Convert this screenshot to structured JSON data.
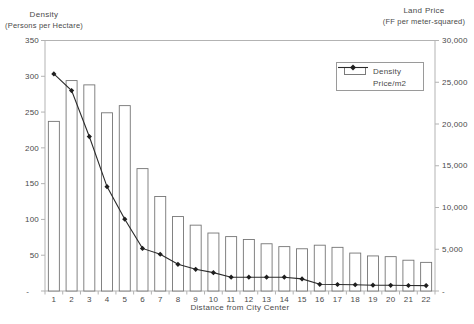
{
  "chart_data": {
    "type": "bar",
    "title": "",
    "categories": [
      "1",
      "2",
      "3",
      "4",
      "5",
      "6",
      "7",
      "8",
      "9",
      "10",
      "11",
      "12",
      "13",
      "14",
      "15",
      "16",
      "17",
      "18",
      "19",
      "20",
      "21",
      "22"
    ],
    "series": [
      {
        "name": "Density",
        "type": "bar",
        "axis": "left",
        "values": [
          237,
          294,
          288,
          249,
          259,
          171,
          132,
          104,
          92,
          81,
          76,
          72,
          66,
          62,
          59,
          64,
          61,
          53,
          49,
          48,
          43,
          40
        ]
      },
      {
        "name": "Price/m2",
        "type": "line",
        "axis": "right",
        "values": [
          26000,
          24000,
          18500,
          12500,
          8600,
          5100,
          4400,
          3200,
          2600,
          2200,
          1650,
          1650,
          1650,
          1650,
          1450,
          800,
          780,
          750,
          700,
          680,
          660,
          650
        ]
      }
    ],
    "left_axis": {
      "title_line1": "Density",
      "title_line2": "(Persons per Hectare)",
      "min": 0,
      "max": 350,
      "step": 50,
      "tick_labels": [
        "350",
        "300",
        "250",
        "200",
        "150",
        "100",
        "50",
        "-"
      ]
    },
    "right_axis": {
      "title_line1": "Land Price",
      "title_line2": "(FF per meter-squared)",
      "min": 0,
      "max": 30000,
      "step": 5000,
      "tick_labels": [
        "30,000",
        "25,000",
        "20,000",
        "15,000",
        "10,000",
        "5,000",
        "-"
      ]
    },
    "x_axis": {
      "title": "Distance from City Center",
      "labels": [
        "1",
        "2",
        "3",
        "4",
        "5",
        "6",
        "7",
        "8",
        "9",
        "10",
        "11",
        "12",
        "13",
        "14",
        "15",
        "16",
        "17",
        "18",
        "19",
        "20",
        "21",
        "22"
      ]
    },
    "legend": {
      "items": [
        {
          "label": "Density",
          "swatch": "bar"
        },
        {
          "label": "Price/m2",
          "swatch": "line-diamond"
        }
      ],
      "position": "inside-top-right"
    },
    "grid": false,
    "colors": {
      "background": "#ffffff",
      "bar_fill": "#ffffff",
      "bar_border": "#757575",
      "line": "#2b2b2b",
      "marker": "#1f1f1f",
      "axis": "#b3b3b3",
      "tick_text": "#4a4a4a",
      "legend_border": "#9a9a9a"
    }
  }
}
